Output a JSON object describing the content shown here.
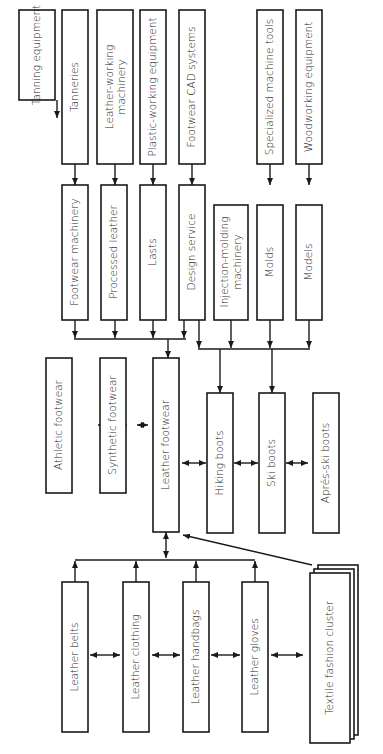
{
  "diagram": {
    "orientation": "rotated-90-ccw",
    "nodes": {
      "tanning_equipment": "Tanning equipment",
      "tanneries": "Tanneries",
      "leather_working_machinery_1": "Leather-working",
      "leather_working_machinery_2": "machinery",
      "plastic_working_equipment": "Plastic-working equipment",
      "footwear_cad_systems": "Footwear CAD systems",
      "specialized_machine_tools": "Specialized machine tools",
      "woodworking_equipment": "Woodworking equipment",
      "footwear_machinery": "Footwear machinery",
      "processed_leather": "Processed leather",
      "lasts": "Lasts",
      "design_service": "Design service",
      "injection_molding_machinery_1": "Injection-molding",
      "injection_molding_machinery_2": "machinery",
      "molds": "Molds",
      "models": "Models",
      "athletic_footwear": "Athletic footwear",
      "synthetic_footwear": "Synthetic footwear",
      "leather_footwear": "Leather footwear",
      "hiking_boots": "Hiking boots",
      "ski_boots": "Ski boots",
      "apres_ski_boots": "Aprés-ski boots",
      "leather_belts": "Leather belts",
      "leather_clothing": "Leather clothing",
      "leather_handbags": "Leather handbags",
      "leather_gloves": "Leather gloves",
      "textile_fashion_cluster": "Textile fashion cluster"
    },
    "edges": [
      {
        "from": "Tanning equipment",
        "to": "Tanneries",
        "type": "arrow"
      },
      {
        "from": "Tanneries",
        "to": "Footwear machinery",
        "type": "arrow"
      },
      {
        "from": "Leather-working machinery",
        "to": "Processed leather",
        "type": "arrow"
      },
      {
        "from": "Plastic-working equipment",
        "to": "Lasts",
        "type": "arrow"
      },
      {
        "from": "Footwear CAD systems",
        "to": "Design service",
        "type": "arrow"
      },
      {
        "from": "Specialized machine tools",
        "to": "Molds",
        "type": "arrow"
      },
      {
        "from": "Woodworking equipment",
        "to": "Models",
        "type": "arrow"
      },
      {
        "from": "Footwear machinery / Processed leather / Lasts / Design service",
        "to": "Leather footwear",
        "type": "bus-arrow"
      },
      {
        "from": "Design service / Injection-molding machinery / Molds / Models",
        "to": "Hiking boots, Ski boots",
        "type": "bus-arrow"
      },
      {
        "from": "Athletic footwear",
        "to": "Synthetic footwear",
        "type": "double-arrow"
      },
      {
        "from": "Synthetic footwear",
        "to": "Leather footwear",
        "type": "double-arrow"
      },
      {
        "from": "Leather footwear",
        "to": "Hiking boots",
        "type": "double-arrow"
      },
      {
        "from": "Hiking boots",
        "to": "Ski boots",
        "type": "double-arrow"
      },
      {
        "from": "Ski boots",
        "to": "Aprés-ski boots",
        "type": "double-arrow"
      },
      {
        "from": "Leather footwear",
        "to": "Leather goods bus",
        "type": "double-arrow"
      },
      {
        "from": "Leather belts",
        "to": "Leather clothing",
        "type": "double-arrow"
      },
      {
        "from": "Leather clothing",
        "to": "Leather handbags",
        "type": "double-arrow"
      },
      {
        "from": "Leather handbags",
        "to": "Leather gloves",
        "type": "double-arrow"
      },
      {
        "from": "Leather gloves",
        "to": "Textile fashion cluster",
        "type": "double-arrow"
      },
      {
        "from": "Textile fashion cluster",
        "to": "Leather footwear",
        "type": "arrow"
      }
    ]
  }
}
